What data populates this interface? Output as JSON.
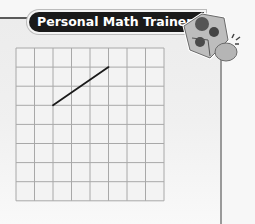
{
  "header": {
    "title": "Personal Math Trainer",
    "mascot_icon": "math-trainer-dice-mascot-icon"
  },
  "grid": {
    "columns": 8,
    "rows": 8,
    "left": 16,
    "top": 48,
    "cell_width": 18.5,
    "cell_height": 19.1,
    "line_color": "#a8a8a8",
    "segment": {
      "from": {
        "col": 2,
        "row": 3
      },
      "to": {
        "col": 5,
        "row": 1
      },
      "color": "#1a1a1a"
    }
  },
  "colors": {
    "title_bg": "#1a1a1a",
    "title_text": "#ffffff",
    "panel_border": "#5a5a5a",
    "background": "#f7f7f7"
  }
}
